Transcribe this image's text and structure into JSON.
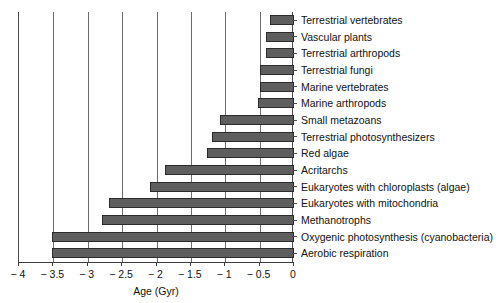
{
  "chart_data": {
    "type": "bar",
    "orientation": "horizontal",
    "title": "",
    "xlabel": "Age (Gyr)",
    "ylabel": "",
    "xlim": [
      -4,
      0
    ],
    "xticks": [
      -4,
      -3.5,
      -3,
      -2.5,
      -2,
      -1.5,
      -1,
      -0.5,
      0
    ],
    "xtick_labels": [
      "− 4",
      "− 3.5",
      "− 3",
      "− 2.5",
      "− 2",
      "− 1.5",
      "− 1",
      "− 0.5",
      "0"
    ],
    "grid": true,
    "grid_axis": "x",
    "legend": "none",
    "bar_color": "#5e5e5e",
    "bar_edge_color": "#2b2b2b",
    "axis_color": "#4a4a4a",
    "categories": [
      "Terrestrial vertebrates",
      "Vascular plants",
      "Terrestrial arthropods",
      "Terrestrial fungi",
      "Marine vertebrates",
      "Marine arthropods",
      "Small metazoans",
      "Terrestrial photosynthesizers",
      "Red algae",
      "Acritarchs",
      "Eukaryotes with chloroplasts (algae)",
      "Eukaryotes with mitochondria",
      "Methanotrophs",
      "Oxygenic photosynthesis (cyanobacteria)",
      "Aerobic respiration"
    ],
    "values": [
      -0.35,
      -0.41,
      -0.41,
      -0.49,
      -0.49,
      -0.53,
      -1.07,
      -1.2,
      -1.27,
      -1.88,
      -2.1,
      -2.69,
      -2.8,
      -3.52,
      -3.52
    ]
  },
  "axis": {
    "x_title": "Age (Gyr)"
  }
}
